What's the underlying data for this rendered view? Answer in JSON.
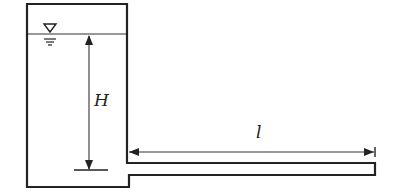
{
  "diagram": {
    "type": "tank-with-horizontal-outlet-pipe",
    "labels": {
      "head": "H",
      "pipe_length": "l"
    },
    "symbols": {
      "free_surface": "water-surface-triangle-icon"
    },
    "colors": {
      "stroke": "#222222",
      "background": "#ffffff"
    }
  }
}
